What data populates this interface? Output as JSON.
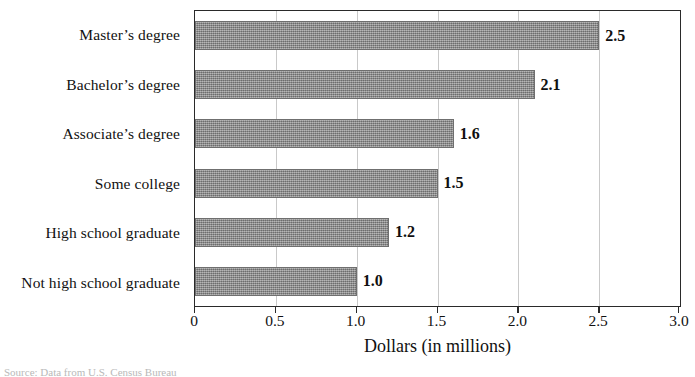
{
  "chart_data": {
    "type": "bar",
    "orientation": "horizontal",
    "title": "",
    "xlabel": "Dollars (in millions)",
    "ylabel": "",
    "xlim": [
      0,
      3.0
    ],
    "xticks": [
      "0",
      "0.5",
      "1.0",
      "1.5",
      "2.0",
      "2.5",
      "3.0"
    ],
    "xtick_values": [
      0,
      0.5,
      1.0,
      1.5,
      2.0,
      2.5,
      3.0
    ],
    "grid": "vertical",
    "legend": "none",
    "bar_color": "#8d8d8d",
    "categories": [
      "Master’s degree",
      "Bachelor’s degree",
      "Associate’s degree",
      "Some college",
      "High school graduate",
      "Not high school graduate"
    ],
    "values": [
      2.5,
      2.1,
      1.6,
      1.5,
      1.2,
      1.0
    ],
    "value_labels": [
      "2.5",
      "2.1",
      "1.6",
      "1.5",
      "1.2",
      "1.0"
    ]
  },
  "source_note": "Source: Data from U.S. Census Bureau"
}
